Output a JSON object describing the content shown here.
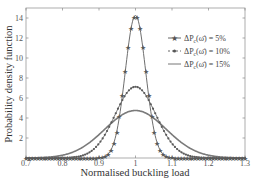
{
  "chart_data": {
    "type": "line",
    "title": "",
    "xlabel": "Normalised buckling load",
    "ylabel": "Probability density function",
    "xlim": [
      0.7,
      1.3
    ],
    "ylim": [
      0,
      15
    ],
    "xticks": [
      0.7,
      0.8,
      0.9,
      1,
      1.1,
      1.2,
      1.3
    ],
    "xtick_labels": [
      "0.7",
      "0.8",
      "0.9",
      "1",
      "1.1",
      "1.2",
      "1.3"
    ],
    "yticks": [
      2,
      4,
      6,
      8,
      10,
      12,
      14
    ],
    "ytick_labels": [
      "2",
      "4",
      "6",
      "8",
      "10",
      "12",
      "14"
    ],
    "grid": false,
    "legend_position": "upper right",
    "series": [
      {
        "name": "ΔP_c(ω̄) = 5%",
        "marker": "star",
        "mean": 1.0,
        "std": 0.028,
        "peak": 14.2,
        "color": "#6e6e6e"
      },
      {
        "name": "ΔP_c(ω̄) = 10%",
        "marker": "dot",
        "mean": 1.0,
        "std": 0.056,
        "peak": 7.1,
        "color": "#6e6e6e"
      },
      {
        "name": "ΔP_c(ω̄) = 15%",
        "marker": "line",
        "mean": 1.0,
        "std": 0.084,
        "peak": 4.75,
        "color": "#7a7a7a"
      }
    ],
    "x": [
      0.7,
      0.75,
      0.8,
      0.85,
      0.9,
      0.925,
      0.95,
      0.975,
      1.0,
      1.025,
      1.05,
      1.075,
      1.1,
      1.15,
      1.2,
      1.25,
      1.3
    ],
    "series_values": {
      "5%": [
        0,
        0,
        0,
        0,
        0.02,
        0.55,
        2.9,
        9.1,
        14.2,
        9.1,
        2.9,
        0.55,
        0.02,
        0,
        0,
        0,
        0
      ],
      "10%": [
        0,
        0,
        0.01,
        0.19,
        1.44,
        2.91,
        4.77,
        6.39,
        7.1,
        6.39,
        4.77,
        2.91,
        1.44,
        0.19,
        0.01,
        0,
        0
      ],
      "15%": [
        0.01,
        0.09,
        0.39,
        1.0,
        2.29,
        3.01,
        3.8,
        4.44,
        4.75,
        4.44,
        3.8,
        3.01,
        2.29,
        1.0,
        0.39,
        0.09,
        0.01
      ]
    }
  },
  "legend": {
    "items": [
      {
        "label": "ΔP_c(ω̄) = 5%",
        "prefix": "ΔP",
        "sub": "c",
        "suffix": "(ω̄) = 5%"
      },
      {
        "label": "ΔP_c(ω̄) = 10%",
        "prefix": "ΔP",
        "sub": "c",
        "suffix": "(ω̄) = 10%"
      },
      {
        "label": "ΔP_c(ω̄) = 15%",
        "prefix": "ΔP",
        "sub": "c",
        "suffix": "(ω̄) = 15%"
      }
    ]
  }
}
